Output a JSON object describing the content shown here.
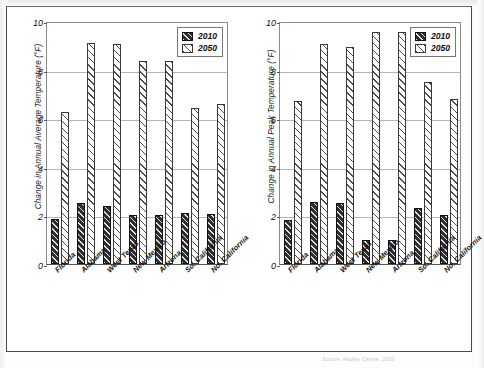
{
  "document": {
    "source_note": "Source: Hadley Centre, 2003"
  },
  "legend": {
    "entries": [
      {
        "label": "2010",
        "pattern": "dark-hatch",
        "color": "#2e2e2e"
      },
      {
        "label": "2050",
        "pattern": "light-hatch",
        "color": "#ffffff"
      }
    ]
  },
  "chart_data": [
    {
      "type": "bar",
      "id": "annual-average-temperature",
      "title": "",
      "xlabel": "",
      "ylabel": "Change in Annual Average Temperature (°F)",
      "ylim": [
        0,
        10
      ],
      "yticks": [
        0,
        2,
        4,
        6,
        8,
        10
      ],
      "grid": true,
      "legend_position": "top-right",
      "categories": [
        "Florida",
        "Alabama",
        "West Texas",
        "New Mexico",
        "Arizona",
        "So. California",
        "No. California"
      ],
      "series": [
        {
          "name": "2010",
          "values": [
            1.85,
            2.5,
            2.4,
            2.0,
            2.0,
            2.1,
            2.05
          ]
        },
        {
          "name": "2050",
          "values": [
            6.25,
            9.1,
            9.05,
            8.35,
            8.35,
            6.4,
            6.6
          ]
        }
      ]
    },
    {
      "type": "bar",
      "id": "annual-peak-temperature",
      "title": "",
      "xlabel": "",
      "ylabel": "Change in Annual Peak Temperature (°F)",
      "ylim": [
        0,
        10
      ],
      "yticks": [
        0,
        2,
        4,
        6,
        8,
        10
      ],
      "grid": true,
      "legend_position": "top-right",
      "categories": [
        "Florida",
        "Alabama",
        "West Texas",
        "New Mexico",
        "Arizona",
        "So. California",
        "No. California"
      ],
      "series": [
        {
          "name": "2010",
          "values": [
            1.8,
            2.55,
            2.5,
            1.0,
            1.0,
            2.3,
            2.0
          ]
        },
        {
          "name": "2050",
          "values": [
            6.7,
            9.05,
            8.95,
            9.55,
            9.55,
            7.5,
            6.8
          ]
        }
      ]
    }
  ]
}
